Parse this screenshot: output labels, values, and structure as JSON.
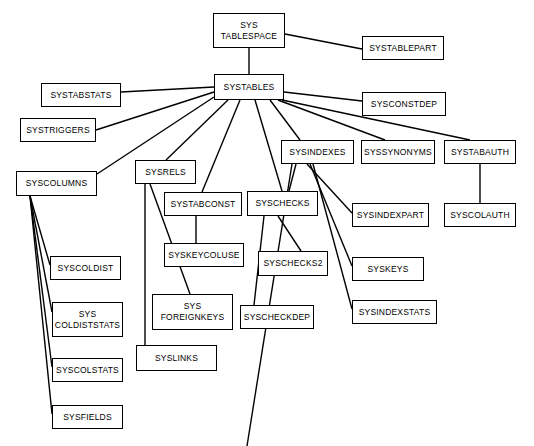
{
  "diagram": {
    "type": "node-link-tree",
    "style": {
      "node_fill": "#ffffff",
      "node_border": "#000000",
      "edge_color": "#000000",
      "text_color": "#000000",
      "background": "#ffffff"
    },
    "nodes": [
      {
        "id": "systablespace",
        "label": "SYS\nTABLESPACE",
        "x": 213,
        "y": 13,
        "w": 72,
        "h": 35
      },
      {
        "id": "systablepart",
        "label": "SYSTABLEPART",
        "x": 362,
        "y": 36,
        "w": 82,
        "h": 24
      },
      {
        "id": "systables",
        "label": "SYSTABLES",
        "x": 214,
        "y": 74,
        "w": 70,
        "h": 26
      },
      {
        "id": "systabstats",
        "label": "SYSTABSTATS",
        "x": 41,
        "y": 83,
        "w": 80,
        "h": 24
      },
      {
        "id": "sysconstdep",
        "label": "SYSCONSTDEP",
        "x": 362,
        "y": 92,
        "w": 84,
        "h": 24
      },
      {
        "id": "systriggers",
        "label": "SYSTRIGGERS",
        "x": 20,
        "y": 118,
        "w": 76,
        "h": 24
      },
      {
        "id": "sysindexes",
        "label": "SYSINDEXES",
        "x": 281,
        "y": 140,
        "w": 73,
        "h": 24
      },
      {
        "id": "syssynonyms",
        "label": "SYSSYNONYMS",
        "x": 361,
        "y": 140,
        "w": 74,
        "h": 24
      },
      {
        "id": "systabauth",
        "label": "SYSTABAUTH",
        "x": 444,
        "y": 140,
        "w": 72,
        "h": 24
      },
      {
        "id": "sysrels",
        "label": "SYSRELS",
        "x": 135,
        "y": 160,
        "w": 61,
        "h": 24
      },
      {
        "id": "syscolumns",
        "label": "SYSCOLUMNS",
        "x": 16,
        "y": 171,
        "w": 81,
        "h": 25
      },
      {
        "id": "systabconst",
        "label": "SYSTABCONST",
        "x": 164,
        "y": 192,
        "w": 78,
        "h": 24
      },
      {
        "id": "syschecks",
        "label": "SYSCHECKS",
        "x": 247,
        "y": 191,
        "w": 71,
        "h": 25
      },
      {
        "id": "sysindexpart",
        "label": "SYSINDEXPART",
        "x": 352,
        "y": 203,
        "w": 77,
        "h": 24
      },
      {
        "id": "syscolauth",
        "label": "SYSCOLAUTH",
        "x": 444,
        "y": 203,
        "w": 72,
        "h": 24
      },
      {
        "id": "syskeycoluse",
        "label": "SYSKEYCOLUSE",
        "x": 164,
        "y": 243,
        "w": 80,
        "h": 24
      },
      {
        "id": "syschecks2",
        "label": "SYSCHECKS2",
        "x": 258,
        "y": 251,
        "w": 70,
        "h": 25
      },
      {
        "id": "syscoldist",
        "label": "SYSCOLDIST",
        "x": 50,
        "y": 256,
        "w": 71,
        "h": 24
      },
      {
        "id": "syskeys",
        "label": "SYSKEYS",
        "x": 352,
        "y": 257,
        "w": 72,
        "h": 24
      },
      {
        "id": "syscoldiststats",
        "label": "SYS\nCOLDISTSTATS",
        "x": 52,
        "y": 302,
        "w": 71,
        "h": 35
      },
      {
        "id": "sysforeignkeys",
        "label": "SYS\nFOREIGNKEYS",
        "x": 152,
        "y": 294,
        "w": 81,
        "h": 36
      },
      {
        "id": "syscheckdep",
        "label": "SYSCHECKDEP",
        "x": 240,
        "y": 305,
        "w": 74,
        "h": 24
      },
      {
        "id": "sysindexstats",
        "label": "SYSINDEXSTATS",
        "x": 352,
        "y": 300,
        "w": 85,
        "h": 24
      },
      {
        "id": "syslinks",
        "label": "SYSLINKS",
        "x": 136,
        "y": 345,
        "w": 81,
        "h": 26
      },
      {
        "id": "syscolstats",
        "label": "SYSCOLSTATS",
        "x": 52,
        "y": 358,
        "w": 71,
        "h": 24
      },
      {
        "id": "sysfields",
        "label": "SYSFIELDS",
        "x": 52,
        "y": 405,
        "w": 71,
        "h": 24
      }
    ],
    "edges": [
      {
        "from": "systablespace",
        "to": "systablepart",
        "x1": 285,
        "y1": 34,
        "x2": 362,
        "y2": 49
      },
      {
        "from": "systablespace",
        "to": "systables",
        "x1": 249,
        "y1": 48,
        "x2": 249,
        "y2": 74
      },
      {
        "from": "systables",
        "to": "systabstats",
        "x1": 214,
        "y1": 87,
        "x2": 121,
        "y2": 92
      },
      {
        "from": "systables",
        "to": "systriggers",
        "x1": 214,
        "y1": 92,
        "x2": 96,
        "y2": 130
      },
      {
        "from": "systables",
        "to": "syscolumns",
        "x1": 214,
        "y1": 97,
        "x2": 97,
        "y2": 174
      },
      {
        "from": "systables",
        "to": "sysconstdep",
        "x1": 284,
        "y1": 92,
        "x2": 362,
        "y2": 101
      },
      {
        "from": "systables",
        "to": "sysindexes",
        "x1": 270,
        "y1": 100,
        "x2": 300,
        "y2": 140
      },
      {
        "from": "systables",
        "to": "syssynonyms",
        "x1": 278,
        "y1": 100,
        "x2": 385,
        "y2": 140
      },
      {
        "from": "systables",
        "to": "systabauth",
        "x1": 282,
        "y1": 100,
        "x2": 470,
        "y2": 140
      },
      {
        "from": "systables",
        "to": "sysrels",
        "x1": 228,
        "y1": 100,
        "x2": 166,
        "y2": 160
      },
      {
        "from": "systables",
        "to": "systabconst",
        "x1": 240,
        "y1": 100,
        "x2": 202,
        "y2": 192
      },
      {
        "from": "systables",
        "to": "syschecks",
        "x1": 255,
        "y1": 100,
        "x2": 282,
        "y2": 191
      },
      {
        "from": "systabauth",
        "to": "syscolauth",
        "x1": 480,
        "y1": 164,
        "x2": 480,
        "y2": 203
      },
      {
        "from": "sysindexes",
        "to": "sysindexpart",
        "x1": 307,
        "y1": 164,
        "x2": 352,
        "y2": 213
      },
      {
        "from": "sysindexes",
        "to": "syskeys",
        "x1": 310,
        "y1": 164,
        "x2": 352,
        "y2": 266
      },
      {
        "from": "sysindexes",
        "to": "sysindexstats",
        "x1": 313,
        "y1": 164,
        "x2": 352,
        "y2": 309
      },
      {
        "from": "sysindexes",
        "to": "syschecks",
        "x1": 296,
        "y1": 164,
        "x2": 289,
        "y2": 191
      },
      {
        "from": "sysindexes",
        "to": "syscolumns_ext",
        "x1": 292,
        "y1": 164,
        "x2": 247,
        "y2": 446
      },
      {
        "from": "syschecks",
        "to": "syschecks2",
        "x1": 278,
        "y1": 216,
        "x2": 301,
        "y2": 251
      },
      {
        "from": "syschecks",
        "to": "syscheckdep",
        "x1": 264,
        "y1": 216,
        "x2": 254,
        "y2": 305
      },
      {
        "from": "systabconst",
        "to": "syskeycoluse",
        "x1": 196,
        "y1": 216,
        "x2": 196,
        "y2": 243
      },
      {
        "from": "sysrels",
        "to": "sysforeignkeys",
        "x1": 150,
        "y1": 184,
        "x2": 190,
        "y2": 294
      },
      {
        "from": "sysrels",
        "to": "syslinks",
        "x1": 145,
        "y1": 184,
        "x2": 145,
        "y2": 345
      },
      {
        "from": "syscolumns",
        "to": "syscoldist",
        "x1": 30,
        "y1": 196,
        "x2": 50,
        "y2": 265
      },
      {
        "from": "syscolumns",
        "to": "syscoldiststats",
        "x1": 30,
        "y1": 196,
        "x2": 52,
        "y2": 312
      },
      {
        "from": "syscolumns",
        "to": "syscolstats",
        "x1": 30,
        "y1": 196,
        "x2": 52,
        "y2": 367
      },
      {
        "from": "syscolumns",
        "to": "sysfields",
        "x1": 30,
        "y1": 196,
        "x2": 52,
        "y2": 414
      }
    ]
  }
}
